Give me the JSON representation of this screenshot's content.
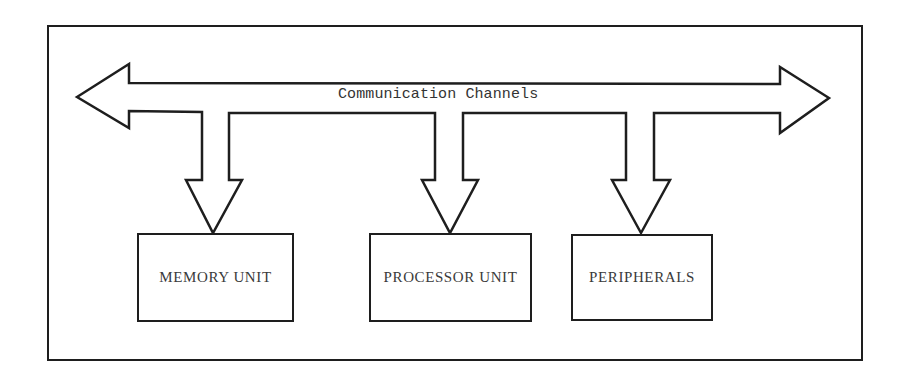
{
  "diagram": {
    "colors": {
      "stroke": "#1e1e1e",
      "text": "#333333",
      "background": "#ffffff"
    },
    "frame": {
      "x": 47,
      "y": 25,
      "w": 816,
      "h": 336
    },
    "bus": {
      "label": "Communication Channels",
      "label_pos": {
        "x": 338,
        "y": 86
      },
      "direction": "bidirectional",
      "outline_points": "77,97 129,64 129,83 780,84 780,67 829,98 780,133 780,113 654,113 654,180 670,180 641,233 612,180 626,180 626,113 463,113 463,180 478,180 450,233 422,180 435,180 435,113 229,113 229,180 242,180 213,233 186,180 202,180 202,112 129,111 129,128"
    },
    "units": [
      {
        "id": "memory",
        "label": "MEMORY UNIT",
        "x": 137,
        "y": 233,
        "w": 157,
        "h": 89
      },
      {
        "id": "processor",
        "label": "PROCESSOR UNIT",
        "x": 369,
        "y": 233,
        "w": 163,
        "h": 89
      },
      {
        "id": "peripherals",
        "label": "PERIPHERALS",
        "x": 571,
        "y": 234,
        "w": 142,
        "h": 87
      }
    ]
  }
}
